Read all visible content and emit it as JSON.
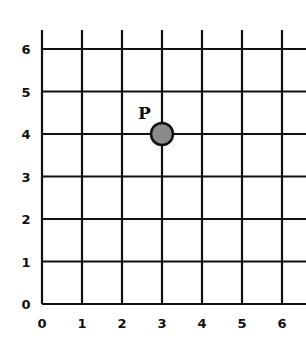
{
  "diagram": {
    "type": "coordinate-grid",
    "x_ticks": [
      "0",
      "1",
      "2",
      "3",
      "4",
      "5",
      "6"
    ],
    "y_ticks": [
      "0",
      "1",
      "2",
      "3",
      "4",
      "5",
      "6"
    ],
    "point": {
      "label": "P",
      "x": 3,
      "y": 4,
      "fill": "#8a8a8a",
      "stroke": "#111111"
    },
    "grid_color": "#111111"
  }
}
